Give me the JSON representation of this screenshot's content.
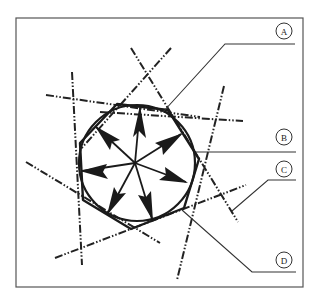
{
  "figure": {
    "labels": [
      {
        "id": "A",
        "text": "A"
      },
      {
        "id": "B",
        "text": "B"
      },
      {
        "id": "C",
        "text": "C"
      },
      {
        "id": "D",
        "text": "D"
      }
    ],
    "colors": {
      "line": "#1a1a1a",
      "frame": "#555555",
      "background": "#ffffff"
    }
  }
}
